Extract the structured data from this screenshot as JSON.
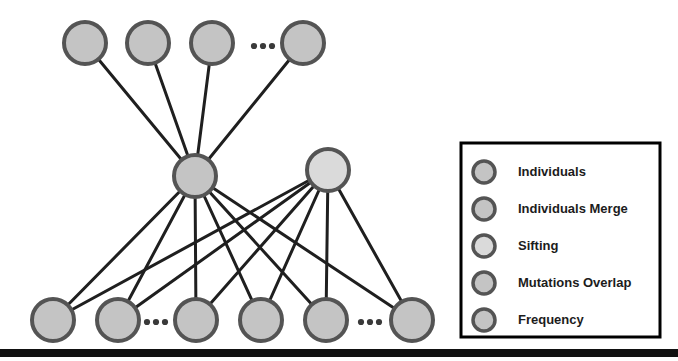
{
  "figure": {
    "background": "#ffffff",
    "bottom_bar_color": "#111111",
    "edge_color": "#1f1f1f",
    "node_stroke_color": "#4a4a4a",
    "ellipsis_color": "#3a3a3a",
    "ellipsis_glyph": "•"
  },
  "colors": {
    "individuals_fill": "#c4c4c4",
    "individuals_merge_fill": "#c4c4c4",
    "sifting_fill": "#dadada",
    "mutations_overlap_fill": "#c4c4c4",
    "frequency_fill": "#c4c4c4",
    "node_ring": "#545454",
    "legend_border": "#000000"
  },
  "graph": {
    "node_radius": 21,
    "node_ring_width": 4,
    "levels": [
      {
        "name": "top-level-individuals",
        "type": "Individuals",
        "fill_key": "individuals_fill",
        "nodes": [
          {
            "id": "t1",
            "cx": 85,
            "cy": 43
          },
          {
            "id": "t2",
            "cx": 148,
            "cy": 43
          },
          {
            "id": "t3",
            "cx": 212,
            "cy": 43
          },
          {
            "id": "t4",
            "cx": 303,
            "cy": 43
          }
        ],
        "ellipsis": [
          {
            "cx": 263,
            "cy": 46
          }
        ]
      },
      {
        "name": "middle-level",
        "nodes": [
          {
            "id": "m1",
            "cx": 195,
            "cy": 176,
            "type": "Individuals Merge",
            "fill_key": "individuals_merge_fill"
          },
          {
            "id": "m2",
            "cx": 328,
            "cy": 170,
            "type": "Sifting",
            "fill_key": "sifting_fill"
          }
        ]
      },
      {
        "name": "bottom-level-frequency",
        "type": "Frequency",
        "fill_key": "frequency_fill",
        "nodes": [
          {
            "id": "b1",
            "cx": 53,
            "cy": 320
          },
          {
            "id": "b2",
            "cx": 118,
            "cy": 320
          },
          {
            "id": "b3",
            "cx": 196,
            "cy": 320
          },
          {
            "id": "b4",
            "cx": 261,
            "cy": 320
          },
          {
            "id": "b5",
            "cx": 326,
            "cy": 320
          },
          {
            "id": "b6",
            "cx": 412,
            "cy": 320
          }
        ],
        "ellipsis": [
          {
            "cx": 156,
            "cy": 322
          },
          {
            "cx": 370,
            "cy": 322
          }
        ]
      }
    ],
    "edges": [
      {
        "from": "t1",
        "to": "m1"
      },
      {
        "from": "t2",
        "to": "m1"
      },
      {
        "from": "t3",
        "to": "m1"
      },
      {
        "from": "t4",
        "to": "m1"
      },
      {
        "from": "m1",
        "to": "b1"
      },
      {
        "from": "m1",
        "to": "b2"
      },
      {
        "from": "m1",
        "to": "b3"
      },
      {
        "from": "m1",
        "to": "b4"
      },
      {
        "from": "m1",
        "to": "b5"
      },
      {
        "from": "m1",
        "to": "b6"
      },
      {
        "from": "m2",
        "to": "b1"
      },
      {
        "from": "m2",
        "to": "b2"
      },
      {
        "from": "m2",
        "to": "b3"
      },
      {
        "from": "m2",
        "to": "b4"
      },
      {
        "from": "m2",
        "to": "b5"
      },
      {
        "from": "m2",
        "to": "b6"
      }
    ],
    "edge_width": 3
  },
  "legend": {
    "box": {
      "x": 461,
      "y": 143,
      "width": 199,
      "height": 194,
      "border_width": 3
    },
    "marker_x": 484,
    "label_x": 518,
    "first_row_y": 172,
    "row_spacing": 37,
    "marker_radius": 11,
    "items": [
      {
        "label": "Individuals",
        "fill_key": "individuals_fill"
      },
      {
        "label": "Individuals Merge",
        "fill_key": "individuals_merge_fill"
      },
      {
        "label": "Sifting",
        "fill_key": "sifting_fill"
      },
      {
        "label": "Mutations Overlap",
        "fill_key": "mutations_overlap_fill"
      },
      {
        "label": "Frequency",
        "fill_key": "frequency_fill"
      }
    ]
  },
  "bottom_bar": {
    "x": 0,
    "y": 349,
    "width": 678,
    "height": 8
  }
}
